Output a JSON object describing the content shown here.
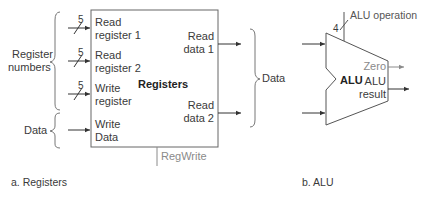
{
  "registers": {
    "block_label": "Registers",
    "inputs": [
      {
        "line1": "Read",
        "line2": "register 1",
        "width": "5"
      },
      {
        "line1": "Read",
        "line2": "register 2",
        "width": "5"
      },
      {
        "line1": "Write",
        "line2": "register",
        "width": "5"
      },
      {
        "line1": "Write",
        "line2": "Data"
      }
    ],
    "outputs": [
      {
        "line1": "Read",
        "line2": "data 1"
      },
      {
        "line1": "Read",
        "line2": "data 2"
      }
    ],
    "group_labels": {
      "register_numbers_line1": "Register",
      "register_numbers_line2": "numbers",
      "data_in": "Data",
      "data_out": "Data"
    },
    "control": "RegWrite",
    "caption": "a. Registers"
  },
  "alu": {
    "block_label": "ALU",
    "operation_label": "ALU operation",
    "operation_width": "4",
    "zero_label": "Zero",
    "result_line1": "ALU",
    "result_line2": "result",
    "caption": "b. ALU"
  },
  "colors": {
    "line": "#555555",
    "gray": "#8a8a8a"
  }
}
